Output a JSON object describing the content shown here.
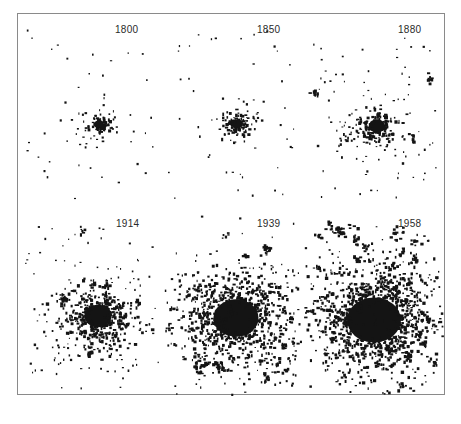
{
  "figure": {
    "ink_color": "#141414",
    "border_color": "#8a8a8a",
    "panels": [
      {
        "year": "1800",
        "row": 0,
        "col": 0,
        "cx": 81,
        "cy": 110,
        "core_r": 5,
        "core_n": 60,
        "mid_r": 16,
        "mid_n": 40,
        "sat_n": 40,
        "blob_n": 0,
        "seed": 11
      },
      {
        "year": "1850",
        "row": 0,
        "col": 1,
        "cx": 77,
        "cy": 110,
        "core_r": 6,
        "core_n": 70,
        "mid_r": 20,
        "mid_n": 50,
        "sat_n": 40,
        "blob_n": 0,
        "seed": 23
      },
      {
        "year": "1880",
        "row": 0,
        "col": 2,
        "cx": 75,
        "cy": 112,
        "core_r": 9,
        "core_n": 120,
        "mid_r": 28,
        "mid_n": 90,
        "sat_n": 55,
        "blob_n": 4,
        "seed": 37
      },
      {
        "year": "1914",
        "row": 1,
        "col": 0,
        "cx": 80,
        "cy": 110,
        "core_r": 15,
        "core_n": 300,
        "mid_r": 38,
        "mid_n": 180,
        "sat_n": 60,
        "blob_n": 14,
        "seed": 41
      },
      {
        "year": "1939",
        "row": 1,
        "col": 1,
        "cx": 76,
        "cy": 112,
        "core_r": 25,
        "core_n": 600,
        "mid_r": 50,
        "mid_n": 260,
        "sat_n": 70,
        "blob_n": 30,
        "seed": 53
      },
      {
        "year": "1958",
        "row": 1,
        "col": 2,
        "cx": 72,
        "cy": 114,
        "core_r": 30,
        "core_n": 800,
        "mid_r": 55,
        "mid_n": 300,
        "sat_n": 70,
        "blob_n": 42,
        "seed": 67
      }
    ],
    "label_positions": [
      {
        "x": 97,
        "y": 10
      },
      {
        "x": 97,
        "y": 10
      },
      {
        "x": 97,
        "y": 10
      },
      {
        "x": 97,
        "y": 12
      },
      {
        "x": 97,
        "y": 12
      },
      {
        "x": 97,
        "y": 12
      }
    ]
  }
}
